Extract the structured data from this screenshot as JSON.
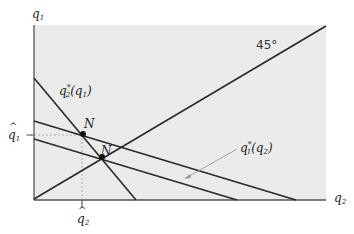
{
  "figure": {
    "type": "reaction-function-diagram",
    "background_color": "#ebebeb",
    "line_color": "#2a2a2a",
    "axes": {
      "y_label": {
        "base": "q",
        "sub": "1"
      },
      "x_label": {
        "base": "q",
        "sub": "2"
      }
    },
    "angle_label": "45°",
    "curves": {
      "best_response_2": {
        "base": "q",
        "sub": "2",
        "sup": "*",
        "arg_base": "q",
        "arg_sub": "1"
      },
      "best_response_1": {
        "base": "q",
        "sub": "1",
        "sup": "*",
        "arg_base": "q",
        "arg_sub": "2"
      }
    },
    "equilibria": [
      {
        "label": "N"
      },
      {
        "label": "N"
      }
    ],
    "tick_labels": {
      "q1_hat": {
        "base": "q",
        "sub": "1"
      },
      "q2_hat": {
        "base": "q",
        "sub": "2"
      }
    }
  }
}
